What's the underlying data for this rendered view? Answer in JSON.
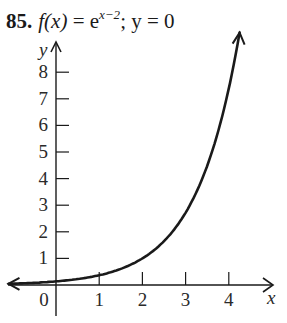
{
  "problem": {
    "number": "85.",
    "func_lhs": "f(x)",
    "eq": " = e",
    "exponent": "x−2",
    "rest": "; y = 0"
  },
  "chart_data": {
    "type": "line",
    "xlabel": "x",
    "ylabel": "y",
    "x_ticks": [
      0,
      1,
      2,
      3,
      4
    ],
    "y_ticks": [
      1,
      2,
      3,
      4,
      5,
      6,
      7,
      8
    ],
    "xlim": [
      -1.2,
      5.0
    ],
    "ylim": [
      -0.5,
      9.2
    ],
    "grid": false,
    "series": [
      {
        "name": "f(x) = e^(x−2)",
        "x": [
          -1.1,
          -0.5,
          0,
          0.5,
          1,
          1.5,
          2,
          2.5,
          3,
          3.5,
          4,
          4.25
        ],
        "values": [
          0.05,
          0.08,
          0.14,
          0.22,
          0.37,
          0.61,
          1.0,
          1.65,
          2.72,
          4.48,
          7.39,
          9.49
        ]
      }
    ],
    "asymptote": "y = 0"
  },
  "axis": {
    "x_label": "x",
    "y_label": "y",
    "x_tick_labels": [
      "0",
      "1",
      "2",
      "3",
      "4"
    ],
    "y_tick_labels": [
      "1",
      "2",
      "3",
      "4",
      "5",
      "6",
      "7",
      "8"
    ]
  },
  "colors": {
    "ink": "#1a1a1a",
    "background": "#ffffff"
  }
}
